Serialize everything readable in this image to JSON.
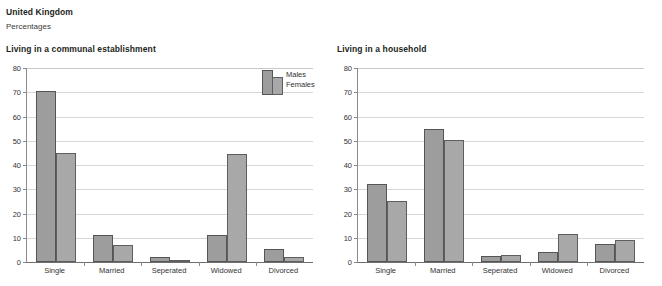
{
  "header": {
    "country": "United Kingdom",
    "units": "Percentages"
  },
  "legend": {
    "males_label": "Males",
    "females_label": "Females"
  },
  "colors": {
    "males_fill": "#9d9d9d",
    "females_fill": "#a8a8a8",
    "bar_border": "#555555",
    "gridline": "#d7d7d7",
    "axis": "#6f6f6f",
    "text": "#231f20"
  },
  "chart_data": [
    {
      "type": "bar",
      "title": "Living in a communal establishment",
      "categories": [
        "Single",
        "Married",
        "Seperated",
        "Widowed",
        "Divorced"
      ],
      "series": [
        {
          "name": "Males",
          "values": [
            70.5,
            11.0,
            2.0,
            11.0,
            5.5
          ]
        },
        {
          "name": "Females",
          "values": [
            45.0,
            7.0,
            0.5,
            44.5,
            2.0
          ]
        }
      ],
      "xlabel": "",
      "ylabel": "",
      "ylim": [
        0,
        80
      ],
      "yticks": [
        0,
        10,
        20,
        30,
        40,
        50,
        60,
        70,
        80
      ],
      "grid": true,
      "legend_position": "top-right"
    },
    {
      "type": "bar",
      "title": "Living in a household",
      "categories": [
        "Single",
        "Married",
        "Seperated",
        "Widowed",
        "Divorced"
      ],
      "series": [
        {
          "name": "Males",
          "values": [
            32.0,
            55.0,
            2.5,
            4.0,
            7.5
          ]
        },
        {
          "name": "Females",
          "values": [
            25.0,
            50.5,
            3.0,
            11.5,
            9.0
          ]
        }
      ],
      "xlabel": "",
      "ylabel": "",
      "ylim": [
        0,
        80
      ],
      "yticks": [
        0,
        10,
        20,
        30,
        40,
        50,
        60,
        70,
        80
      ],
      "grid": true,
      "legend_position": "top-right"
    }
  ]
}
